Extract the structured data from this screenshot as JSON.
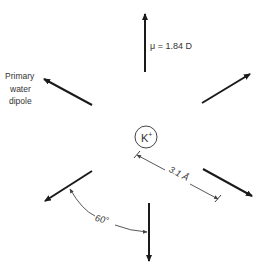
{
  "diagram": {
    "ion_label": "K",
    "ion_charge": "+",
    "dipole_label": "μ = 1.84 D",
    "primary_label_lines": [
      "Primary",
      "water",
      "dipole"
    ],
    "distance_label": "3.1 Å",
    "angle_label": "60°",
    "colors": {
      "stroke": "#1a1a1a",
      "thin": "#444444",
      "text": "#333333",
      "background": "#ffffff"
    },
    "dipole_count": 6
  }
}
